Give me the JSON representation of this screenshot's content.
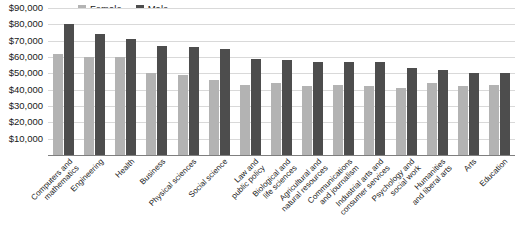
{
  "chart_data": {
    "type": "bar",
    "title": "",
    "subtitle": "",
    "xlabel": "",
    "ylabel": "",
    "ylim": [
      0,
      90000
    ],
    "grid": true,
    "legend_position": "top-left",
    "y_ticks": [
      "$10,000",
      "$20,000",
      "$30,000",
      "$40,000",
      "$50,000",
      "$60,000",
      "$70,000",
      "$80,000",
      "$90,000"
    ],
    "y_tick_values": [
      10000,
      20000,
      30000,
      40000,
      50000,
      60000,
      70000,
      80000,
      90000
    ],
    "categories": [
      "Computers and mathematics",
      "Engineering",
      "Health",
      "Business",
      "Physical sciences",
      "Social science",
      "Law and public policy",
      "Biological and life sciences",
      "Agricultural and natural resources",
      "Communications and journalism",
      "Industrial arts and consumer services",
      "Psychology and social work",
      "Humanities and liberal arts",
      "Arts",
      "Education"
    ],
    "category_lines": [
      [
        "Computers and",
        "mathematics"
      ],
      [
        "Engineering"
      ],
      [
        "Health"
      ],
      [
        "Business"
      ],
      [
        "Physical sciences"
      ],
      [
        "Social science"
      ],
      [
        "Law and",
        "public policy"
      ],
      [
        "Biological and",
        "life sciences"
      ],
      [
        "Agricultural and",
        "natural resources"
      ],
      [
        "Communications",
        "and journalism"
      ],
      [
        "Industrial arts and",
        "consumer services"
      ],
      [
        "Psychology and",
        "social work"
      ],
      [
        "Humanities",
        "and liberal arts"
      ],
      [
        "Arts"
      ],
      [
        "Education"
      ]
    ],
    "series": [
      {
        "name": "Female",
        "color": "#b3b3b3",
        "values": [
          62000,
          60000,
          60000,
          50000,
          49000,
          46000,
          43000,
          44000,
          42000,
          43000,
          42000,
          41000,
          44000,
          42000,
          43000
        ]
      },
      {
        "name": "Male",
        "color": "#4d4d4d",
        "values": [
          80000,
          74000,
          71000,
          67000,
          66000,
          65000,
          59000,
          58000,
          57000,
          57000,
          57000,
          53000,
          52000,
          50000,
          50000
        ]
      }
    ]
  },
  "legend": {
    "items": [
      {
        "label": "Female",
        "color": "#b3b3b3"
      },
      {
        "label": "Male",
        "color": "#4d4d4d"
      }
    ]
  },
  "colors": {
    "female": "#b3b3b3",
    "male": "#4d4d4d",
    "gridline": "#d9d9d9",
    "axis": "#7f7f7f",
    "text": "#1a1a1a",
    "background": "#ffffff"
  }
}
